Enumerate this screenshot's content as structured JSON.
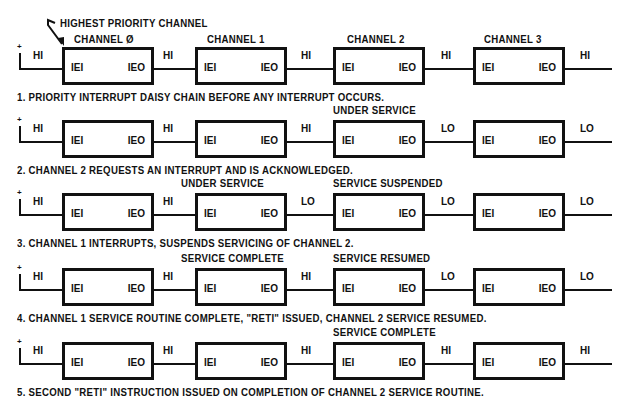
{
  "title_annotation": "HIGHEST PRIORITY CHANNEL",
  "channels": [
    "CHANNEL Ø",
    "CHANNEL 1",
    "CHANNEL 2",
    "CHANNEL 3"
  ],
  "pin_labels": {
    "input": "IEI",
    "output": "IEO"
  },
  "supply_symbol": "+",
  "rows": [
    {
      "caption": "1. PRIORITY INTERRUPT DAISY CHAIN BEFORE ANY INTERRUPT OCCURS.",
      "signals": [
        "HI",
        "HI",
        "HI",
        "HI",
        "HI"
      ],
      "status": [
        "",
        "",
        "",
        ""
      ]
    },
    {
      "caption": "2. CHANNEL 2 REQUESTS AN INTERRUPT AND IS ACKNOWLEDGED.",
      "signals": [
        "HI",
        "HI",
        "HI",
        "LO",
        "LO"
      ],
      "status": [
        "",
        "",
        "UNDER SERVICE",
        ""
      ]
    },
    {
      "caption": "3. CHANNEL 1 INTERRUPTS, SUSPENDS SERVICING OF CHANNEL 2.",
      "signals": [
        "HI",
        "HI",
        "LO",
        "LO",
        "LO"
      ],
      "status": [
        "",
        "UNDER SERVICE",
        "SERVICE SUSPENDED",
        ""
      ]
    },
    {
      "caption": "4. CHANNEL 1 SERVICE ROUTINE COMPLETE, \"RETI\" ISSUED, CHANNEL 2 SERVICE RESUMED.",
      "signals": [
        "HI",
        "HI",
        "HI",
        "LO",
        "LO"
      ],
      "status": [
        "",
        "SERVICE COMPLETE",
        "SERVICE RESUMED",
        ""
      ]
    },
    {
      "caption": "5. SECOND \"RETI\" INSTRUCTION ISSUED ON COMPLETION OF CHANNEL 2 SERVICE ROUTINE.",
      "signals": [
        "HI",
        "HI",
        "HI",
        "HI",
        "HI"
      ],
      "status": [
        "",
        "",
        "SERVICE COMPLETE",
        ""
      ]
    }
  ]
}
